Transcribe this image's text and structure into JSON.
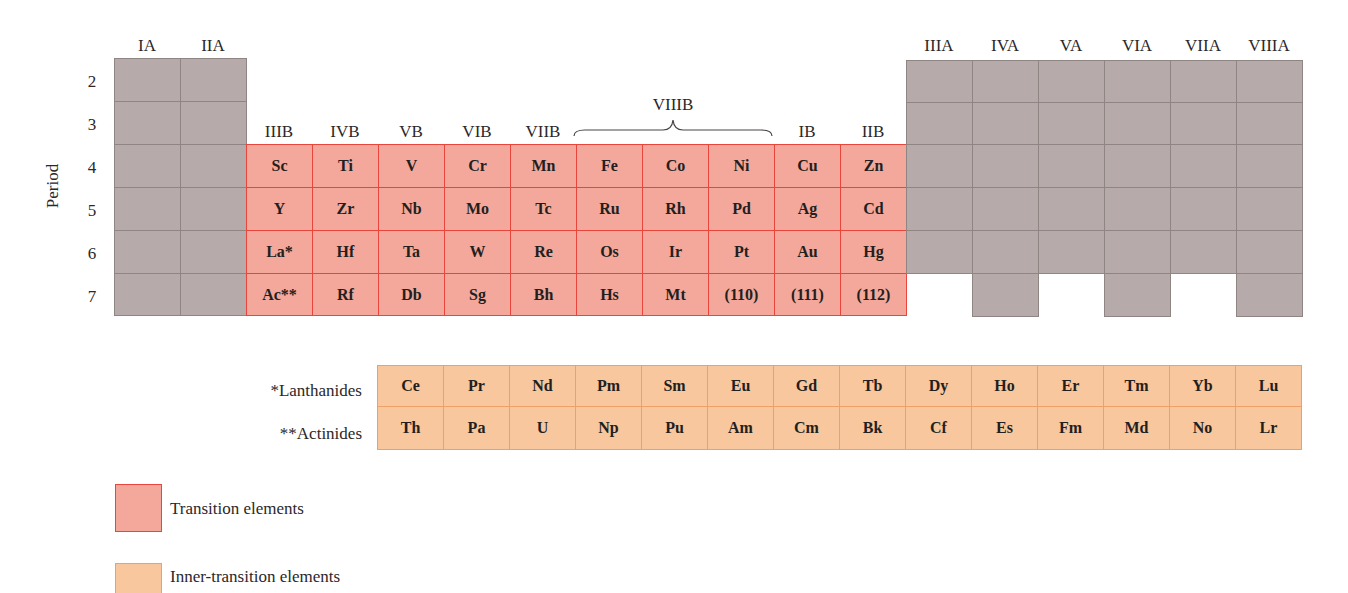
{
  "colors": {
    "main_group": "#b6abaa",
    "transition": "#f4a89b",
    "transition_border": "#e8463c",
    "inner_transition": "#f8c79d",
    "inner_transition_border": "#efa066"
  },
  "axis": {
    "period_title": "Period",
    "periods": [
      "2",
      "3",
      "4",
      "5",
      "6",
      "7"
    ]
  },
  "groups": {
    "left": [
      "IA",
      "IIA"
    ],
    "transition": [
      "IIIB",
      "IVB",
      "VB",
      "VIB",
      "VIIB",
      "IB",
      "IIB"
    ],
    "viiib": "VIIIB",
    "right": [
      "IIIA",
      "IVA",
      "VA",
      "VIA",
      "VIIA",
      "VIIIA"
    ]
  },
  "transition_elements": [
    [
      "Sc",
      "Ti",
      "V",
      "Cr",
      "Mn",
      "Fe",
      "Co",
      "Ni",
      "Cu",
      "Zn"
    ],
    [
      "Y",
      "Zr",
      "Nb",
      "Mo",
      "Tc",
      "Ru",
      "Rh",
      "Pd",
      "Ag",
      "Cd"
    ],
    [
      "La*",
      "Hf",
      "Ta",
      "W",
      "Re",
      "Os",
      "Ir",
      "Pt",
      "Au",
      "Hg"
    ],
    [
      "Ac**",
      "Rf",
      "Db",
      "Sg",
      "Bh",
      "Hs",
      "Mt",
      "(110)",
      "(111)",
      "(112)"
    ]
  ],
  "inner_transition": {
    "lanthanides_label": "*Lanthanides",
    "actinides_label": "**Actinides",
    "lanthanides": [
      "Ce",
      "Pr",
      "Nd",
      "Pm",
      "Sm",
      "Eu",
      "Gd",
      "Tb",
      "Dy",
      "Ho",
      "Er",
      "Tm",
      "Yb",
      "Lu"
    ],
    "actinides": [
      "Th",
      "Pa",
      "U",
      "Np",
      "Pu",
      "Am",
      "Cm",
      "Bk",
      "Cf",
      "Es",
      "Fm",
      "Md",
      "No",
      "Lr"
    ]
  },
  "legend": [
    {
      "label": "Transition elements",
      "color": "#f4a89b"
    },
    {
      "label": "Inner-transition elements",
      "color": "#f8c79d"
    }
  ]
}
